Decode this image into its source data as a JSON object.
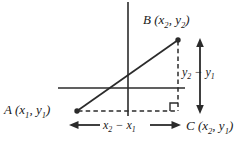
{
  "figure": {
    "colors": {
      "stroke": "#2b2b2b",
      "text": "#1a1a1a",
      "background": "#ffffff"
    },
    "points": {
      "A": {
        "label_name": "A",
        "x_text": "x",
        "x_sub": "1",
        "y_text": "y",
        "y_sub": "1",
        "px": 77,
        "py": 111
      },
      "B": {
        "label_name": "B",
        "x_text": "x",
        "x_sub": "2",
        "y_text": "y",
        "y_sub": "2",
        "px": 178,
        "py": 40
      },
      "C": {
        "label_name": "C",
        "x_text": "x",
        "x_sub": "2",
        "y_text": "y",
        "y_sub": "1",
        "px": 178,
        "py": 111
      }
    },
    "labels": {
      "A_name": "A",
      "A_open": " (",
      "A_x": "x",
      "A_xsub": "1",
      "A_comma": ", ",
      "A_y": "y",
      "A_ysub": "1",
      "A_close": ")",
      "B_name": "B",
      "B_open": " (",
      "B_x": "x",
      "B_xsub": "2",
      "B_comma": ", ",
      "B_y": "y",
      "B_ysub": "2",
      "B_close": ")",
      "C_name": "C",
      "C_open": " (",
      "C_x": "x",
      "C_xsub": "2",
      "C_comma": ", ",
      "C_y": "y",
      "C_ysub": "1",
      "C_close": ")",
      "dy_y2": "y",
      "dy_sub2": "2",
      "dy_minus": " − ",
      "dy_y1": "y",
      "dy_sub1": "1",
      "dx_x2": "x",
      "dx_sub2": "2",
      "dx_minus": " − ",
      "dx_x1": "x",
      "dx_sub1": "1"
    },
    "axes": {
      "vertical": {
        "x": 128,
        "y_top": 2,
        "y_bottom": 116
      },
      "horizontal": {
        "y": 88,
        "x_left": 58,
        "x_right": 185
      }
    },
    "segments": {
      "hypotenuse": {
        "name": "segment-AB",
        "style": "solid"
      },
      "horizontal_leg": {
        "name": "segment-AC",
        "style": "dashed"
      },
      "vertical_leg": {
        "name": "segment-BC",
        "style": "dashed"
      }
    },
    "markers": {
      "right_angle": {
        "name": "right-angle-marker",
        "px": 178,
        "py": 111,
        "size": 8
      }
    },
    "dimension_arrows": {
      "vertical": {
        "name": "delta-y-arrow",
        "x": 200,
        "y_top": 40,
        "y_bottom": 112
      },
      "horizontal": {
        "name": "delta-x-arrow",
        "y": 125,
        "x_left": 70,
        "x_right": 180
      }
    }
  }
}
